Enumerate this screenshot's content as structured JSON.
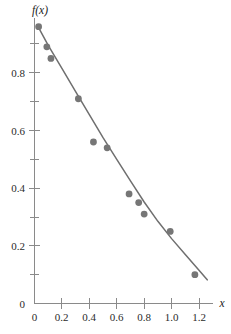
{
  "chart_data": {
    "type": "scatter",
    "title": "",
    "subtitle": "",
    "xlabel": "x",
    "ylabel": "f(x)",
    "xlim": [
      0,
      1.28
    ],
    "ylim": [
      0,
      1.0
    ],
    "grid": false,
    "legend": null,
    "x_ticks": [
      0,
      0.2,
      0.4,
      0.6,
      0.8,
      1.0,
      1.2
    ],
    "x_tick_labels": [
      "0",
      "0.2",
      "0.4",
      "0.6",
      "0.8",
      "1.0",
      "1.2"
    ],
    "y_ticks": [
      0,
      0.2,
      0.4,
      0.6,
      0.8
    ],
    "y_tick_labels": [
      "0",
      "0.2",
      "0.4",
      "0.6",
      "0.8"
    ],
    "y_minor_ticks": [
      0.1,
      0.3,
      0.5,
      0.7,
      0.9
    ],
    "marker_color": "#767676",
    "line_color": "#6f6f6f",
    "axis_color": "#8a8a8a",
    "series": [
      {
        "name": "observations",
        "kind": "scatter",
        "marker": "circle",
        "x": [
          0.03,
          0.09,
          0.12,
          0.32,
          0.43,
          0.53,
          0.69,
          0.76,
          0.8,
          0.99,
          1.17
        ],
        "y": [
          0.96,
          0.89,
          0.85,
          0.71,
          0.56,
          0.54,
          0.38,
          0.35,
          0.31,
          0.25,
          0.1
        ]
      },
      {
        "name": "fitted-curve",
        "kind": "line",
        "x": [
          0.02,
          0.1,
          0.2,
          0.3,
          0.4,
          0.5,
          0.6,
          0.7,
          0.8,
          0.9,
          1.0,
          1.1,
          1.2,
          1.26
        ],
        "y": [
          0.965,
          0.895,
          0.815,
          0.735,
          0.655,
          0.575,
          0.5,
          0.425,
          0.352,
          0.285,
          0.225,
          0.17,
          0.115,
          0.082
        ]
      }
    ]
  },
  "axis_titles": {
    "y": "f(x)",
    "x": "x"
  },
  "x_tick_labels": [
    "0",
    "0.2",
    "0.4",
    "0.6",
    "0.8",
    "1.0",
    "1.2"
  ],
  "y_tick_labels": [
    "0",
    "0.2",
    "0.4",
    "0.6",
    "0.8"
  ]
}
